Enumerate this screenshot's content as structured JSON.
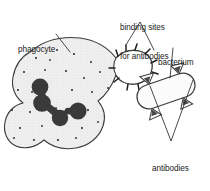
{
  "figure": {
    "type": "biology-diagram",
    "background_color": "#ffffff",
    "ink_color": "#1a1a1a"
  },
  "labels": {
    "phagocyte": {
      "text": "phagocyte",
      "lines": [
        "phagocyte"
      ]
    },
    "binding_sites": {
      "text": "binding sites for antibodies",
      "lines": [
        "binding sites",
        "for antibodies"
      ]
    },
    "bacterium": {
      "text": "bacterium",
      "lines": [
        "bacterium"
      ]
    },
    "antibodies": {
      "text": "antibodies attached to antigens",
      "lines": [
        "antibodies",
        "attached",
        "to antigens"
      ]
    }
  },
  "caption": {
    "text": ""
  },
  "colors": {
    "outline": "#3c3c3c",
    "cell_fill": "#efefef",
    "nucleus": "#3a3a3a",
    "granule": "#2e2e2e",
    "bacterium_fill": "#fbfbfb",
    "antibody_fill": "#4a4a4a",
    "leader_line": "#2b2b2b"
  },
  "structures": {
    "phagocyte": {
      "name": "phagocyte",
      "description": "amoeboid white blood cell with stippled cytoplasm, lobed nucleus and a concave engulfing notch on its right side"
    },
    "nucleus": {
      "name": "nucleus",
      "lobes": 4
    },
    "binding_sites": {
      "name": "binding sites for antibodies",
      "count": 11,
      "description": "short dark tick marks projecting from the membrane of the engulfing notch"
    },
    "bacterium": {
      "name": "bacterium",
      "shape": "rod (capsule)",
      "description": "rounded rectangle tilted about -20 degrees to the right of the phagocyte"
    },
    "antibodies": {
      "name": "antibodies attached to antigens",
      "count": 4,
      "shape": "triangle",
      "description": "small dark triangles attached around the bacterium surface"
    }
  }
}
